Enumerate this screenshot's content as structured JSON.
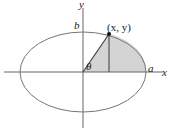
{
  "diagram": {
    "type": "ellipse-sector",
    "labels": {
      "x_axis": "x",
      "y_axis": "y",
      "point": "(x, y)",
      "semi_minor": "b",
      "semi_major": "a",
      "angle": "θ"
    },
    "colors": {
      "ellipse": "#777777",
      "axes": "#555555",
      "shade": "#d4d4d4",
      "point": "#111111"
    }
  }
}
